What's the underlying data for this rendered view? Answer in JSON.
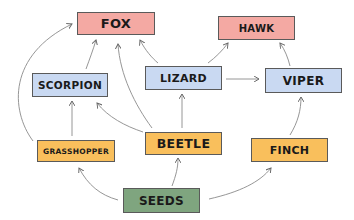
{
  "diagram": {
    "type": "food-web",
    "colors": {
      "top_predator": "#f4a9a3",
      "secondary_consumer": "#c9d9f2",
      "primary_consumer": "#f9bf5c",
      "producer": "#7fa57f",
      "arrow": "#6b6b6b"
    },
    "nodes": {
      "fox": {
        "label": "FOX"
      },
      "hawk": {
        "label": "HAWK"
      },
      "scorpion": {
        "label": "SCORPION"
      },
      "lizard": {
        "label": "LIZARD"
      },
      "viper": {
        "label": "VIPER"
      },
      "grasshopper": {
        "label": "GRASSHOPPER"
      },
      "beetle": {
        "label": "BEETLE"
      },
      "finch": {
        "label": "FINCH"
      },
      "seeds": {
        "label": "SEEDS"
      }
    },
    "edges": [
      {
        "from": "SEEDS",
        "to": "GRASSHOPPER"
      },
      {
        "from": "SEEDS",
        "to": "BEETLE"
      },
      {
        "from": "SEEDS",
        "to": "FINCH"
      },
      {
        "from": "GRASSHOPPER",
        "to": "SCORPION"
      },
      {
        "from": "GRASSHOPPER",
        "to": "FOX"
      },
      {
        "from": "BEETLE",
        "to": "SCORPION"
      },
      {
        "from": "BEETLE",
        "to": "FOX"
      },
      {
        "from": "BEETLE",
        "to": "LIZARD"
      },
      {
        "from": "SCORPION",
        "to": "FOX"
      },
      {
        "from": "LIZARD",
        "to": "FOX"
      },
      {
        "from": "LIZARD",
        "to": "HAWK"
      },
      {
        "from": "LIZARD",
        "to": "VIPER"
      },
      {
        "from": "VIPER",
        "to": "HAWK"
      },
      {
        "from": "FINCH",
        "to": "VIPER"
      }
    ]
  }
}
